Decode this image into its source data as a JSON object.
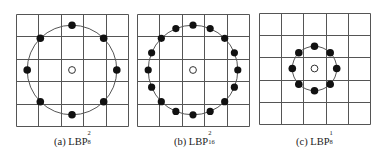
{
  "figure": {
    "grid_size": 5,
    "colors": {
      "grid": "#555555",
      "circle": "#555555",
      "point_fill": "#111111",
      "center_fill": "#ffffff",
      "center_stroke": "#333333"
    },
    "panels": [
      {
        "id": "a",
        "label_prefix": "(a) LBP",
        "sup": "2",
        "sub": "8",
        "points": 8,
        "radius_cells": 2,
        "box": {
          "x": 16,
          "y": 14,
          "size": 112
        },
        "caption_pos": {
          "x": 54,
          "y": 135
        }
      },
      {
        "id": "b",
        "label_prefix": "(b) LBP",
        "sup": "2",
        "sub": "16",
        "points": 16,
        "radius_cells": 2,
        "box": {
          "x": 137,
          "y": 14,
          "size": 112
        },
        "caption_pos": {
          "x": 174,
          "y": 135
        }
      },
      {
        "id": "c",
        "label_prefix": "(c) LBP",
        "sup": "1",
        "sub": "8",
        "points": 8,
        "radius_cells": 1,
        "box": {
          "x": 259,
          "y": 13,
          "size": 111
        },
        "caption_pos": {
          "x": 296,
          "y": 135
        }
      }
    ]
  }
}
